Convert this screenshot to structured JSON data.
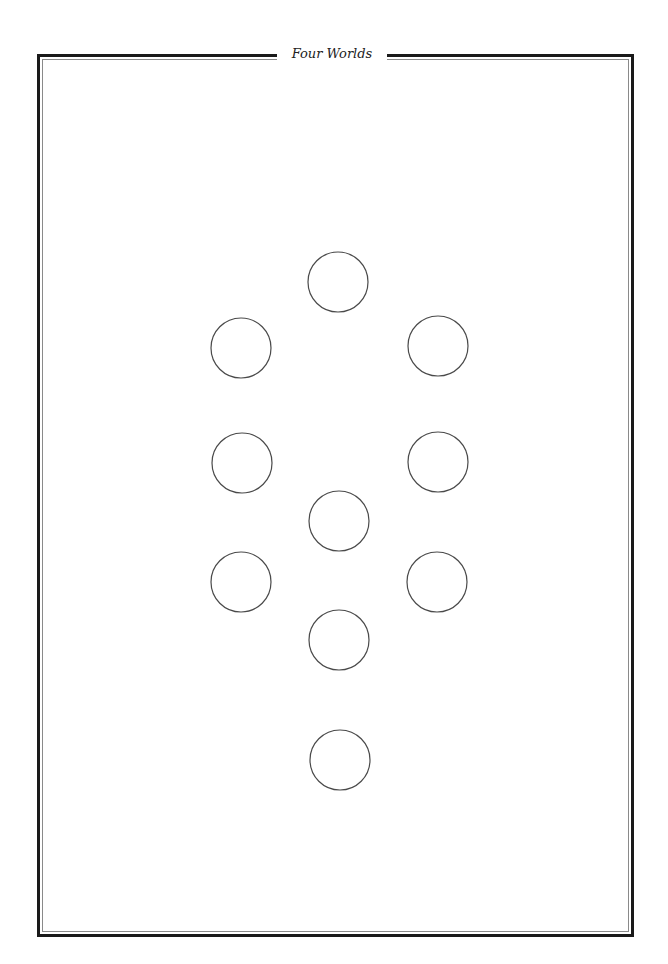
{
  "page": {
    "title": "Four Worlds"
  },
  "colors": {
    "frame_outer": "#1a1a1a",
    "frame_inner": "#8a8a8a",
    "circle_stroke": "#4a4a4a",
    "background": "#ffffff"
  },
  "diagram": {
    "type": "tree-of-life-blank",
    "circle_radius": 30,
    "nodes": [
      {
        "id": "node-1",
        "position": "top-center",
        "cx": 338,
        "cy": 282
      },
      {
        "id": "node-2",
        "position": "upper-right",
        "cx": 438,
        "cy": 346
      },
      {
        "id": "node-3",
        "position": "upper-left",
        "cx": 241,
        "cy": 348
      },
      {
        "id": "node-4",
        "position": "middle-right",
        "cx": 438,
        "cy": 462
      },
      {
        "id": "node-5",
        "position": "middle-left",
        "cx": 242,
        "cy": 463
      },
      {
        "id": "node-6",
        "position": "center",
        "cx": 339,
        "cy": 521
      },
      {
        "id": "node-7",
        "position": "lower-right",
        "cx": 437,
        "cy": 582
      },
      {
        "id": "node-8",
        "position": "lower-left",
        "cx": 241,
        "cy": 582
      },
      {
        "id": "node-9",
        "position": "lower-center",
        "cx": 339,
        "cy": 640
      },
      {
        "id": "node-10",
        "position": "bottom-center",
        "cx": 340,
        "cy": 760
      }
    ]
  }
}
